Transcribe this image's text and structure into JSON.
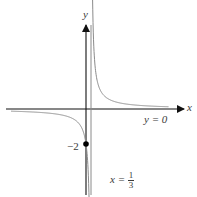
{
  "chart_data": {
    "type": "line",
    "title": "",
    "function": "y = 2/(3x - 1)",
    "xlabel": "x",
    "ylabel": "y",
    "grid": false,
    "legend": null,
    "asymptotes": {
      "vertical": {
        "x": 0.3333,
        "label": "x = 1/3"
      },
      "horizontal": {
        "y": 0,
        "label": "y = 0"
      }
    },
    "points": [
      {
        "x": 0,
        "y": -2,
        "label": "-2",
        "marker": "filled-circle"
      }
    ],
    "series": [
      {
        "name": "left-branch",
        "x": [
          -5.0,
          -4.0,
          -3.0,
          -2.0,
          -1.0,
          -0.5,
          -0.2,
          0.0,
          0.1,
          0.2,
          0.25,
          0.3
        ],
        "values": [
          -0.125,
          -0.154,
          -0.2,
          -0.286,
          -0.5,
          -0.8,
          -1.25,
          -2.0,
          -2.857,
          -5.0,
          -8.0,
          -20.0
        ]
      },
      {
        "name": "right-branch",
        "x": [
          0.38,
          0.4,
          0.45,
          0.5,
          0.6,
          0.8,
          1.0,
          1.5,
          2.0,
          3.0,
          4.0,
          5.0,
          5.5
        ],
        "values": [
          14.29,
          10.0,
          5.71,
          4.0,
          2.5,
          1.43,
          1.0,
          0.571,
          0.4,
          0.25,
          0.182,
          0.143,
          0.13
        ]
      }
    ],
    "xlim": [
      -5.4,
      6.8
    ],
    "ylim": [
      -5.0,
      4.8
    ]
  },
  "labels": {
    "x_axis": "x",
    "y_axis": "y",
    "point_value": "−2",
    "horizontal_asymptote": "y = 0",
    "vertical_asymptote_prefix": "x =",
    "vertical_asymptote_num": "1",
    "vertical_asymptote_den": "3"
  },
  "colors": {
    "axis": "#111111",
    "curve": "#8a8a8a",
    "asymptote": "#8a8a8a",
    "text": "#3a3a3a",
    "point": "#000000"
  }
}
